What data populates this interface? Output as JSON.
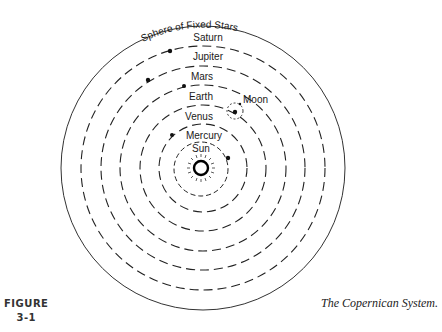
{
  "diagram": {
    "title_arc": "Sphere of Fixed Stars",
    "bodies": [
      {
        "name": "Saturn"
      },
      {
        "name": "Jupiter"
      },
      {
        "name": "Mars"
      },
      {
        "name": "Earth"
      },
      {
        "name": "Moon"
      },
      {
        "name": "Venus"
      },
      {
        "name": "Mercury"
      },
      {
        "name": "Sun"
      }
    ],
    "colors": {
      "ink": "#1a1a1a",
      "background": "#ffffff"
    }
  },
  "figure": {
    "label": "FIGURE",
    "number": "3-1",
    "caption": "The Copernican System."
  }
}
